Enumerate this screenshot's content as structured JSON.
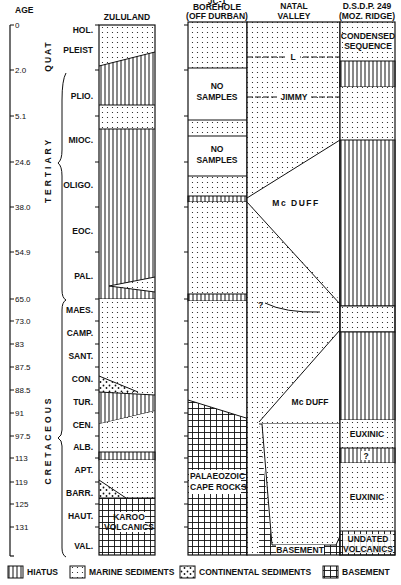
{
  "axis": {
    "title": "AGE",
    "ticks": [
      {
        "label": "0",
        "y": 25
      },
      {
        "label": "2.0",
        "y": 70
      },
      {
        "label": "5.1",
        "y": 116
      },
      {
        "label": "24.6",
        "y": 162
      },
      {
        "label": "38.0",
        "y": 207
      },
      {
        "label": "54.9",
        "y": 252
      },
      {
        "label": "65.0",
        "y": 299
      },
      {
        "label": "73.0",
        "y": 321
      },
      {
        "label": "83",
        "y": 344
      },
      {
        "label": "87.5",
        "y": 367
      },
      {
        "label": "88.5",
        "y": 390
      },
      {
        "label": "91",
        "y": 413
      },
      {
        "label": "97.5",
        "y": 436
      },
      {
        "label": "113",
        "y": 458
      },
      {
        "label": "119",
        "y": 482
      },
      {
        "label": "125",
        "y": 504
      },
      {
        "label": "131",
        "y": 527
      }
    ]
  },
  "periods": [
    {
      "label": "QUAT",
      "y": 45
    },
    {
      "label": "TERTIARY",
      "y": 170
    },
    {
      "label": "CRETACEOUS",
      "y": 425
    }
  ],
  "epochs": [
    {
      "label": "HOL.",
      "y": 30
    },
    {
      "label": "PLEIST",
      "y": 50
    },
    {
      "label": "PLIO.",
      "y": 96
    },
    {
      "label": "MIOC.",
      "y": 140
    },
    {
      "label": "OLIGO.",
      "y": 185
    },
    {
      "label": "EOC.",
      "y": 231
    },
    {
      "label": "PAL.",
      "y": 276
    },
    {
      "label": "MAES.",
      "y": 310
    },
    {
      "label": "CAMP.",
      "y": 333
    },
    {
      "label": "SANT.",
      "y": 356
    },
    {
      "label": "CON.",
      "y": 379
    },
    {
      "label": "TUR.",
      "y": 402
    },
    {
      "label": "CEN.",
      "y": 425
    },
    {
      "label": "ALB.",
      "y": 447
    },
    {
      "label": "APT.",
      "y": 470
    },
    {
      "label": "BARR.",
      "y": 493
    },
    {
      "label": "HAUT.",
      "y": 516
    },
    {
      "label": "VAL.",
      "y": 546
    }
  ],
  "columns": {
    "zululand": {
      "title": "ZULULAND",
      "karoo": [
        "KAROO",
        "VOLCANICS"
      ]
    },
    "borehole": {
      "title_lines": [
        "JC-1",
        "BOREHOLE",
        "(OFF DURBAN)"
      ],
      "no_samples": [
        "NO",
        "SAMPLES"
      ],
      "palaeozoic": [
        "PALAEOZOIC",
        "CAPE ROCKS"
      ]
    },
    "natal": {
      "title_lines": [
        "NATAL",
        "VALLEY"
      ],
      "reflectors": [
        "L",
        "JIMMY"
      ],
      "units": [
        "ANGUS",
        "Mc DUFF",
        "BASEMENT"
      ],
      "question": "?"
    },
    "dsdp": {
      "title_lines": [
        "D.S.D.P. 249",
        "(MOZ. RIDGE)"
      ],
      "condensed": [
        "CONDENSED",
        "SEQUENCE"
      ],
      "euxinic": "EUXINIC",
      "question": "?",
      "undated": [
        "UNDATED",
        "VOLCANICS"
      ]
    }
  },
  "legend": [
    {
      "pattern": "hiatus",
      "label": "HIATUS"
    },
    {
      "pattern": "marine",
      "label": "MARINE SEDIMENTS"
    },
    {
      "pattern": "continental",
      "label": "CONTINENTAL SEDIMENTS"
    },
    {
      "pattern": "basement",
      "label": "BASEMENT"
    }
  ]
}
